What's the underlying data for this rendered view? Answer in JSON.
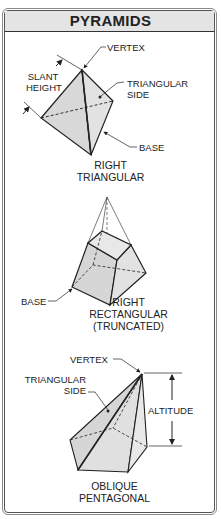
{
  "title": "PYRAMIDS",
  "colors": {
    "face_fill": "#dcdcdc",
    "header_fill": "#e4e4e4",
    "line": "#222222"
  },
  "figures": [
    {
      "id": "right-triangular",
      "caption": [
        "RIGHT",
        "TRIANGULAR"
      ],
      "labels": {
        "vertex": "VERTEX",
        "slant_height": [
          "SLANT",
          "HEIGHT"
        ],
        "triangular_side": [
          "TRIANGULAR",
          "SIDE"
        ],
        "base": "BASE"
      }
    },
    {
      "id": "right-rectangular-truncated",
      "caption": [
        "RIGHT",
        "RECTANGULAR",
        "(TRUNCATED)"
      ],
      "labels": {
        "base": "BASE"
      }
    },
    {
      "id": "oblique-pentagonal",
      "caption": [
        "OBLIQUE",
        "PENTAGONAL"
      ],
      "labels": {
        "vertex": "VERTEX",
        "triangular_side": [
          "TRIANGULAR",
          "SIDE"
        ],
        "altitude": "ALTITUDE"
      }
    }
  ]
}
